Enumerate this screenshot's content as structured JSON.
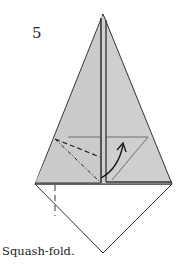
{
  "step": {
    "number": "5"
  },
  "caption": {
    "text": "Squash-fold."
  },
  "colors": {
    "paper_colored": "#cfcfcf",
    "paper_white": "#ffffff",
    "line": "#333333"
  },
  "legend": {
    "valley_fold": "dashed line",
    "mountain_fold": "dash-dot line",
    "arrow": "curved arrow indicating squash-fold direction"
  }
}
